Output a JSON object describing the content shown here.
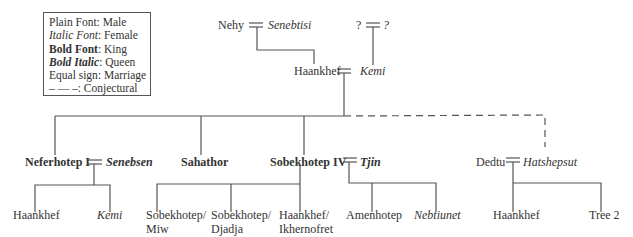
{
  "legend": {
    "items": [
      {
        "key": "Plain Font",
        "value": "Male",
        "style": "plain"
      },
      {
        "key": "Italic Font",
        "value": "Female",
        "style": "italic"
      },
      {
        "key": "Bold Font",
        "value": "King",
        "style": "bold"
      },
      {
        "key": "Bold Italic",
        "value": "Queen",
        "style": "bold-italic"
      },
      {
        "key": "Equal sign",
        "value": "Marriage",
        "style": "plain"
      },
      {
        "key": "– — –",
        "value": "Conjectural",
        "style": "plain"
      }
    ]
  },
  "people": {
    "nehy": "Nehy",
    "senebtisi": "Senebtisi",
    "unknown_husband": "?",
    "unknown_wife": "?",
    "haankhef_gen1": "Haankhef",
    "kemi_gen1": "Kemi",
    "neferhotep": "Neferhotep I",
    "senebsen": "Senebsen",
    "sahathor": "Sahathor",
    "sobekhotep": "Sobekhotep IV",
    "tjin": "Tjin",
    "dedtu": "Dedtu",
    "hatshepsut": "Hatshepsut",
    "haankhef_gen3": "Haankhef",
    "kemi_gen3": "Kemi",
    "sobekhotep_miw_1": "Sobekhotep/",
    "sobekhotep_miw_2": "Miw",
    "sobekhotep_djadja_1": "Sobekhotep/",
    "sobekhotep_djadja_2": "Djadja",
    "haankhef_ikhernofret_1": "Haankhef/",
    "haankhef_ikhernofret_2": "Ikhernofret",
    "amenhotep": "Amenhotep",
    "nebtiunet": "Nebtiunet",
    "haankhef_dedtu": "Haankhef",
    "tree2": "Tree 2"
  },
  "colors": {
    "line": "#555555",
    "text": "#333333"
  }
}
